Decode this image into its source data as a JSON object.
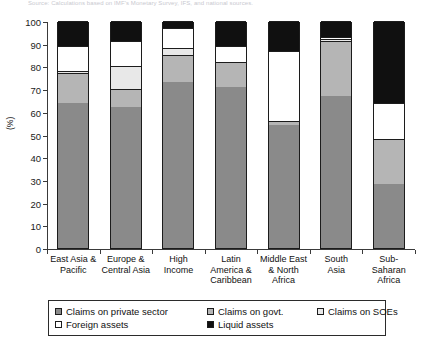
{
  "notes": {
    "top": "Source: Calculations based on IMF's Monetary Survey, IFS, and national sources.",
    "bottom": ""
  },
  "chart_data": {
    "type": "bar",
    "stacked": true,
    "title": "",
    "xlabel": "",
    "ylabel": "(%)",
    "ylim": [
      0,
      100
    ],
    "yticks": [
      0,
      10,
      20,
      30,
      40,
      50,
      60,
      70,
      80,
      90,
      100
    ],
    "grid": false,
    "legend_position": "bottom",
    "categories": [
      "East Asia & Pacific",
      "Europe & Central Asia",
      "High Income",
      "Latin America & Caribbean",
      "Middle East & North Africa",
      "South Asia",
      "Sub-Saharan Africa"
    ],
    "category_lines": [
      [
        "East Asia &",
        "Pacific"
      ],
      [
        "Europe &",
        "Central Asia"
      ],
      [
        "High",
        "Income"
      ],
      [
        "Latin",
        "America &",
        "Caribbean"
      ],
      [
        "Middle East",
        "& North",
        "Africa"
      ],
      [
        "South",
        "Asia"
      ],
      [
        "Sub-",
        "Saharan",
        "Africa"
      ]
    ],
    "series": [
      {
        "name": "Claims on private sector",
        "color": "#8a8a8a",
        "values": [
          64,
          62,
          73,
          71,
          54,
          67,
          28
        ]
      },
      {
        "name": "Claims on govt.",
        "color": "#b5b5b5",
        "values": [
          13,
          8,
          12,
          11,
          2,
          24,
          20
        ]
      },
      {
        "name": "Claims on SOEs",
        "color": "#e8e8e8",
        "values": [
          1,
          10,
          3,
          0,
          0,
          1,
          0
        ]
      },
      {
        "name": "Foreign assets",
        "color": "#ffffff",
        "values": [
          11,
          11,
          9,
          7,
          31,
          1,
          16
        ]
      },
      {
        "name": "Liquid assets",
        "color": "#101010",
        "values": [
          11,
          9,
          3,
          11,
          13,
          7,
          36
        ]
      }
    ]
  }
}
